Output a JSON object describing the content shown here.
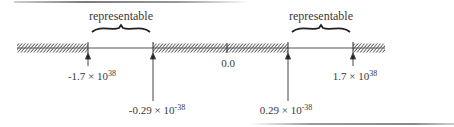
{
  "diagram": {
    "region_label": "representable",
    "regions": [
      {
        "name": "negative-representable",
        "label": "representable",
        "from": "-1.7 × 10^38",
        "to": "-0.29 × 10^-38"
      },
      {
        "name": "positive-representable",
        "label": "representable",
        "from": "0.29 × 10^-38",
        "to": "1.7 × 10^38"
      }
    ],
    "origin_label": "0.0",
    "markers": [
      {
        "id": "neg-max",
        "mantissa": "-1.7 × 10",
        "exponent": "38"
      },
      {
        "id": "neg-min",
        "mantissa": "-0.29 × 10",
        "exponent": "-38"
      },
      {
        "id": "pos-min",
        "mantissa": "0.29 × 10",
        "exponent": "-38"
      },
      {
        "id": "pos-max",
        "mantissa": "1.7 × 10",
        "exponent": "38"
      }
    ],
    "colors": {
      "line": "#555555",
      "hatch": "#444444",
      "text": "#3a3a3a"
    }
  }
}
